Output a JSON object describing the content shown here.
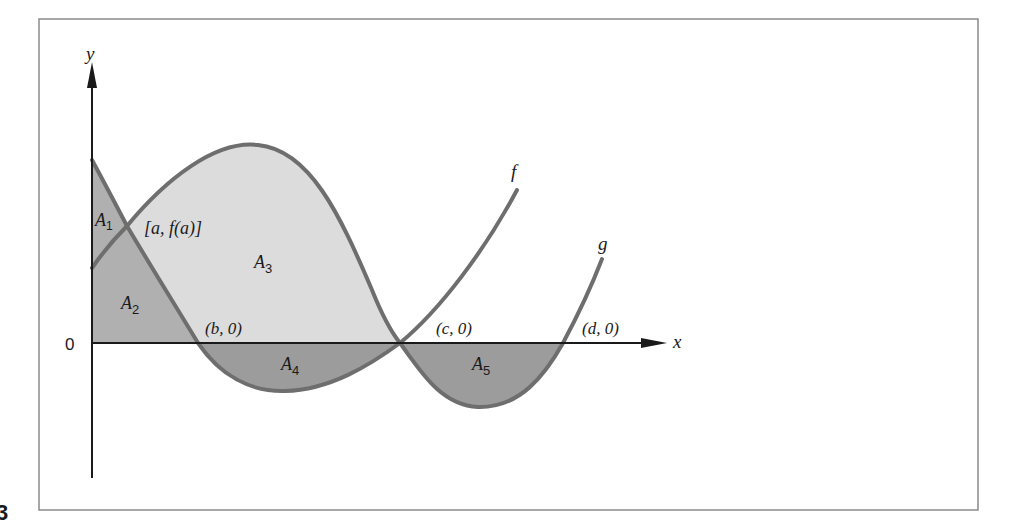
{
  "figure": {
    "number_fragment": "3",
    "axes": {
      "x_label": "x",
      "y_label": "y",
      "origin_label": "0"
    },
    "curves": [
      {
        "name": "f",
        "label": "f"
      },
      {
        "name": "g",
        "label": "g"
      }
    ],
    "points": {
      "a": "[a, f(a)]",
      "b": "(b, 0)",
      "c": "(c, 0)",
      "d": "(d, 0)"
    },
    "regions": [
      {
        "id": "A1",
        "letter": "A",
        "sub": "1"
      },
      {
        "id": "A2",
        "letter": "A",
        "sub": "2"
      },
      {
        "id": "A3",
        "letter": "A",
        "sub": "3"
      },
      {
        "id": "A4",
        "letter": "A",
        "sub": "4"
      },
      {
        "id": "A5",
        "letter": "A",
        "sub": "5"
      }
    ],
    "colors": {
      "frame": "#8a8a8a",
      "axis": "#1a1a1a",
      "curve": "#6e6e6e",
      "light_fill": "#dcdcdc",
      "mid_fill": "#b0b0b0",
      "dark_fill": "#9c9c9c"
    }
  }
}
